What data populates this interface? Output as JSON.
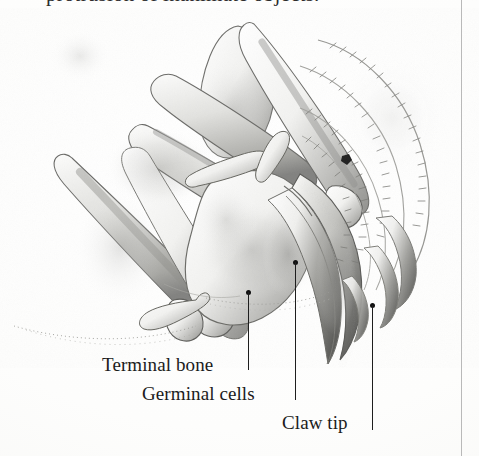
{
  "page": {
    "kind": "scanned-book-figure",
    "running_text_partial": "protrusion of inanimate objects.",
    "background_color": "#fdfdfc",
    "ink_color": "#1b1b1b",
    "gutter_rule_color": "#b9b9b9"
  },
  "figure": {
    "medium": "graphite pencil illustration",
    "palette": "grayscale"
  },
  "callouts": [
    {
      "id": "terminal-bone",
      "label": "Terminal bone",
      "leader_x": 248,
      "leader_top": 290,
      "leader_bottom": 370
    },
    {
      "id": "germinal-cells",
      "label": "Germinal cells",
      "leader_x": 295,
      "leader_top": 260,
      "leader_bottom": 400
    },
    {
      "id": "claw-tip",
      "label": "Claw tip",
      "leader_x": 372,
      "leader_top": 303,
      "leader_bottom": 430
    }
  ]
}
